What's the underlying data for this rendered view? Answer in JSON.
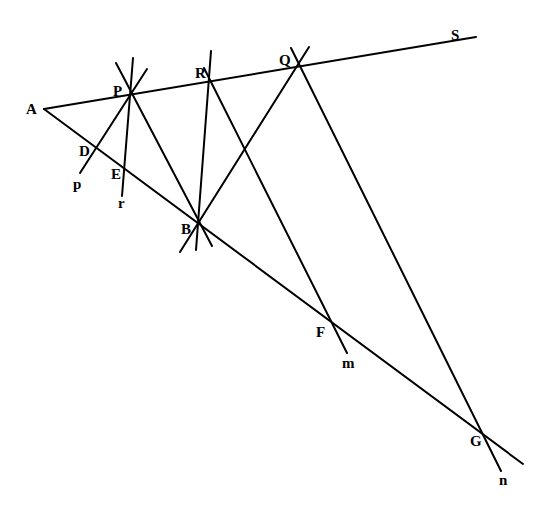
{
  "diagram": {
    "type": "geometric construction",
    "points": {
      "A": {
        "label": "A",
        "x": 44,
        "y": 109
      },
      "P": {
        "label": "P",
        "x": 131,
        "y": 93
      },
      "R": {
        "label": "R",
        "x": 209,
        "y": 80
      },
      "Q": {
        "label": "Q",
        "x": 297,
        "y": 66
      },
      "S": {
        "label": "S",
        "x": 455,
        "y": 42
      },
      "D": {
        "label": "D",
        "x": 96,
        "y": 149
      },
      "E": {
        "label": "E",
        "x": 124,
        "y": 168
      },
      "B": {
        "label": "B",
        "x": 198,
        "y": 224
      },
      "F": {
        "label": "F",
        "x": 331,
        "y": 322
      },
      "G": {
        "label": "G",
        "x": 482,
        "y": 435
      }
    },
    "line_labels": {
      "p": "p",
      "r": "r",
      "m": "m",
      "n": "n"
    },
    "segments": [
      {
        "name": "ray-AS",
        "x1": 44,
        "y1": 109,
        "x2": 476,
        "y2": 37
      },
      {
        "name": "ray-AG",
        "x1": 44,
        "y1": 109,
        "x2": 523,
        "y2": 464
      },
      {
        "name": "line-p",
        "x1": 147,
        "y1": 69,
        "x2": 80,
        "y2": 173
      },
      {
        "name": "line-r",
        "x1": 133,
        "y1": 58,
        "x2": 122,
        "y2": 196
      },
      {
        "name": "line-PB",
        "x1": 116,
        "y1": 63,
        "x2": 212,
        "y2": 246
      },
      {
        "name": "line-RB",
        "x1": 211,
        "y1": 51,
        "x2": 196,
        "y2": 250
      },
      {
        "name": "line-QB",
        "x1": 309,
        "y1": 47,
        "x2": 180,
        "y2": 252
      },
      {
        "name": "line-m",
        "x1": 204,
        "y1": 68,
        "x2": 347,
        "y2": 353
      },
      {
        "name": "line-n",
        "x1": 291,
        "y1": 48,
        "x2": 501,
        "y2": 471
      }
    ]
  }
}
